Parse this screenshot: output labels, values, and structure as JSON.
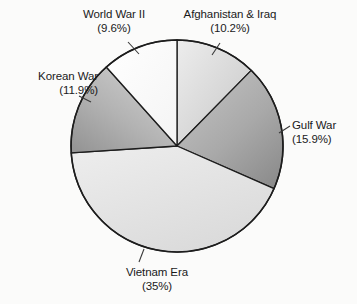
{
  "chart_data": {
    "type": "pie",
    "title": "",
    "subtitle": "",
    "xlabel": "",
    "ylabel": "",
    "legend": "none",
    "grid": false,
    "start_angle_deg": 0,
    "direction": "clockwise",
    "units": "percent",
    "categories": [
      "Afghanistan & Iraq",
      "Gulf War",
      "Vietnam Era",
      "Korean War",
      "World War II"
    ],
    "values": [
      10.2,
      15.9,
      35,
      11.9,
      9.6
    ],
    "slices": [
      {
        "name": "Afghanistan & Iraq",
        "value": 10.2,
        "label": "Afghanistan & Iraq",
        "percent_text": "(10.2%)",
        "fill": "#e3e3e3",
        "fill_dark": "#c9c9c9",
        "start_deg": 0,
        "end_deg": 36.72
      },
      {
        "name": "Gulf War",
        "value": 15.9,
        "label": "Gulf War",
        "percent_text": "(15.9%)",
        "fill": "#b0b0b0",
        "fill_dark": "#8f8f8f",
        "start_deg": 36.72,
        "end_deg": 93.96
      },
      {
        "name": "Vietnam Era",
        "value": 35,
        "label": "Vietnam Era",
        "percent_text": "(35%)",
        "fill": "#e9e9e9",
        "fill_dark": "#dadada",
        "start_deg": 93.96,
        "end_deg": 219.96
      },
      {
        "name": "Korean War",
        "value": 11.9,
        "label": "Korean War",
        "percent_text": "(11.9%)",
        "fill": "#bdbdbd",
        "fill_dark": "#9a9a9a",
        "start_deg": 219.96,
        "end_deg": 262.8
      },
      {
        "name": "World War II",
        "value": 9.6,
        "label": "World War II",
        "percent_text": "(9.6%)",
        "fill": "#fdfdfd",
        "fill_dark": "#f2f2f2",
        "start_deg": 262.8,
        "end_deg": 297.36
      }
    ],
    "colors": {
      "outline": "#1d1d1d",
      "leader_line": "#3a3a3a",
      "text": "#1a1a1a",
      "background": "#fbfbfa"
    },
    "geometry": {
      "center_x": 177,
      "center_y": 146,
      "radius": 106
    }
  },
  "labels": {
    "world_war_ii": {
      "name": "World War II",
      "pct": "(9.6%)"
    },
    "afghanistan_iraq": {
      "name": "Afghanistan & Iraq",
      "pct": "(10.2%)"
    },
    "korean_war": {
      "name": "Korean War",
      "pct": "(11.9%)"
    },
    "gulf_war": {
      "name": "Gulf War",
      "pct": "(15.9%)"
    },
    "vietnam_era": {
      "name": "Vietnam Era",
      "pct": "(35%)"
    }
  }
}
